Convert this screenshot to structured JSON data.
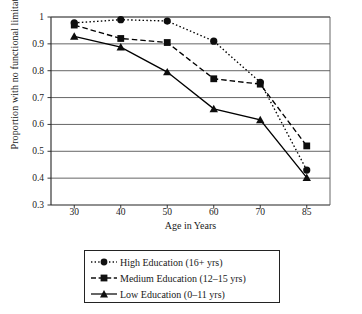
{
  "chart_data": {
    "type": "line",
    "title": "",
    "xlabel": "Age in Years",
    "ylabel": "Proportion with no functional limitations",
    "categories": [
      "30",
      "40",
      "50",
      "60",
      "70",
      "85"
    ],
    "x": [
      30,
      40,
      50,
      60,
      70,
      85
    ],
    "ylim": [
      0.3,
      1
    ],
    "yticks": [
      "0.3",
      "0.4",
      "0.5",
      "0.6",
      "0.7",
      "0.8",
      "0.9",
      "1"
    ],
    "ytick_values": [
      0.3,
      0.4,
      0.5,
      0.6,
      0.7,
      0.8,
      0.9,
      1.0
    ],
    "grid": "horizontal",
    "legend_position": "below-plot",
    "series": [
      {
        "name": "High Education (16+ yrs)",
        "values": [
          0.978,
          0.99,
          0.985,
          0.91,
          0.757,
          0.43
        ],
        "marker": "circle",
        "line_style": "dotted",
        "color": "#000000"
      },
      {
        "name": "Medium Education (12–15 yrs)",
        "values": [
          0.97,
          0.92,
          0.905,
          0.77,
          0.75,
          0.52
        ],
        "marker": "square",
        "line_style": "dashed",
        "color": "#000000"
      },
      {
        "name": "Low Education (0–11 yrs)",
        "values": [
          0.928,
          0.888,
          0.795,
          0.658,
          0.617,
          0.402
        ],
        "marker": "triangle",
        "line_style": "solid",
        "color": "#000000"
      }
    ]
  },
  "axis": {
    "y_title": "Proportion with no functional limitations",
    "x_title": "Age in Years"
  },
  "legend": {
    "entries": [
      "High Education (16+ yrs)",
      "Medium Education (12–15 yrs)",
      "Low Education (0–11 yrs)"
    ]
  },
  "colors": {
    "ink": "#232323",
    "grid": "#555555",
    "background": "#ffffff"
  }
}
